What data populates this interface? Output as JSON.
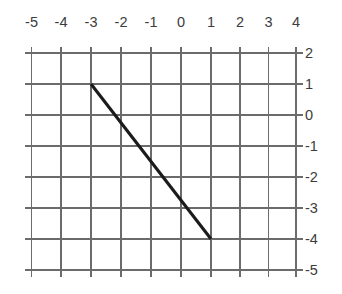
{
  "chart_data": {
    "type": "line",
    "title": "",
    "subtitle": "",
    "xlabel": "",
    "ylabel": "",
    "grid": true,
    "legend": "none",
    "background_color": "#ffffff",
    "grid_color": "#6b6b6b",
    "line_color": "#1b1b1b",
    "label_color": "#3c3c3c",
    "xlim": [
      -5,
      4
    ],
    "ylim": [
      -5,
      2
    ],
    "x_tick_labels": [
      "-5",
      "-4",
      "-3",
      "-2",
      "-1",
      "0",
      "1",
      "2",
      "3",
      "4"
    ],
    "x_tick_values": [
      -5,
      -4,
      -3,
      -2,
      -1,
      0,
      1,
      2,
      3,
      4
    ],
    "x_axis_position": "top",
    "y_tick_labels": [
      "2",
      "1",
      "0",
      "-1",
      "-2",
      "-3",
      "-4",
      "-5"
    ],
    "y_tick_values": [
      2,
      1,
      0,
      -1,
      -2,
      -3,
      -4,
      -5
    ],
    "y_axis_position": "right",
    "series": [
      {
        "name": "segment",
        "points": [
          {
            "x": -3,
            "y": 1
          },
          {
            "x": 1,
            "y": -4
          }
        ],
        "slope": -1.25,
        "endpoints_label": "(-3, 1) to (1, -4)"
      }
    ]
  },
  "geometry": {
    "x_pixels": [
      31.5,
      61.0,
      91.0,
      121.0,
      151.0,
      181.0,
      211.0,
      240.0,
      268.5,
      296.0
    ],
    "y_pixels": [
      53.0,
      84.0,
      115.0,
      146.0,
      177.0,
      208.0,
      239.0,
      270.0
    ],
    "tick_overhang": 6.5,
    "x_label_baseline": 27,
    "y_label_x": 305
  }
}
